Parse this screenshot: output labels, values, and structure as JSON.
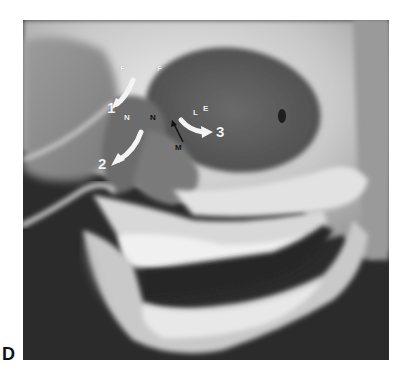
{
  "figure": {
    "panel_letter": "D",
    "labels": {
      "F_left": "F",
      "F_right": "F",
      "N_left": "N",
      "N_right": "N",
      "M": "M",
      "L": "L",
      "E": "E",
      "arrow_1": "1",
      "arrow_2": "2",
      "arrow_3": "3"
    },
    "colors": {
      "background": "#2a2a2a",
      "bone_light": "#e6e6e6",
      "bone_mid": "#bdbdbd",
      "cavity_dark": "#5a5a5a",
      "arrow_white": "#f4f4f4",
      "label_black": "#111111"
    }
  }
}
